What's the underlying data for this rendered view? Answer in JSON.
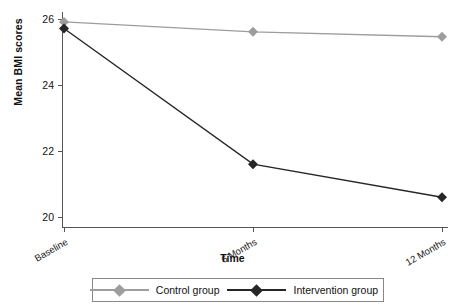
{
  "chart_data": {
    "type": "line",
    "title": "",
    "xlabel": "Time",
    "ylabel": "Mean BMI scores",
    "categories": [
      "Baseline",
      "6 Months",
      "12 Months"
    ],
    "yticks": [
      20,
      22,
      24,
      26
    ],
    "ylim": [
      19.7,
      26.2
    ],
    "grid": false,
    "legend_position": "bottom",
    "series": [
      {
        "name": "Control group",
        "color": "#9d9d9d",
        "marker": "diamond",
        "values": [
          25.9,
          25.6,
          25.45
        ]
      },
      {
        "name": "Intervention group",
        "color": "#262626",
        "marker": "diamond",
        "values": [
          25.7,
          21.6,
          20.6
        ]
      }
    ]
  },
  "axes": {
    "y_label": "Mean BMI scores",
    "x_label": "Time",
    "y_tick_labels": [
      "26",
      "24",
      "22",
      "20"
    ],
    "x_tick_labels": [
      "Baseline",
      "6 Months",
      "12 Months"
    ]
  },
  "legend": {
    "entries": [
      {
        "label": "Control group",
        "color": "#9d9d9d"
      },
      {
        "label": "Intervention group",
        "color": "#262626"
      }
    ]
  }
}
